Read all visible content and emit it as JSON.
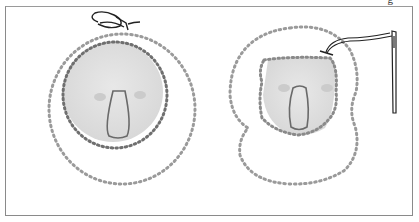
{
  "figure": {
    "panels": [
      {
        "id": "left",
        "description": "Round koala face patch with nose, outlined by running stitches, with an outer circle of stitches and a knotted thread end at the top"
      },
      {
        "id": "right",
        "description": "Koala face with ears outlined by running stitches, with needle and thread inserted at upper right"
      }
    ],
    "cutoff_glyph": "g",
    "colors": {
      "stitch": "#8f8f8f",
      "stitch_dark": "#6b6b6b",
      "face_fill": "#e2e2e2",
      "nose": "#6a6a6a",
      "frame": "#8a8a8a",
      "cheek": "#cfcfcf"
    }
  }
}
